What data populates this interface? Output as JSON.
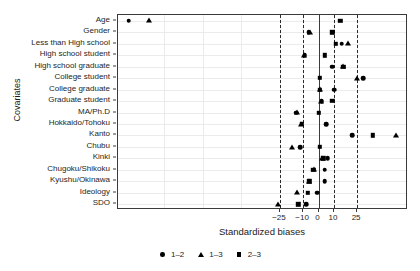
{
  "chart_data": {
    "type": "scatter",
    "title": "",
    "xlabel": "Standardized biases",
    "ylabel": "Covariates",
    "xlim": [
      -130,
      58
    ],
    "xticks": [
      -25,
      -10,
      0,
      10,
      25
    ],
    "xtick_labels": [
      "−25",
      "−10",
      "0",
      "10",
      "25"
    ],
    "reference_lines": {
      "dashed": [
        -25,
        -10,
        10,
        25
      ],
      "solid": [
        0
      ]
    },
    "grid": true,
    "legend_position": "bottom",
    "categories": [
      "Age",
      "Gender",
      "Less than High school",
      "High school student",
      "High school graduate",
      "College student",
      "College graduate",
      "Graduate student",
      "MA/Ph.D",
      "Hokkaido/Tohoku",
      "Kanto",
      "Chubu",
      "Kinki",
      "Chugoku/Shikoku",
      "Kyushu/Okinawa",
      "Ideology",
      "SDO"
    ],
    "series": [
      {
        "name": "1–2",
        "marker": "circle",
        "values": [
          -123,
          -6.5,
          15,
          -9,
          9,
          29,
          10,
          2,
          -14.5,
          5,
          22,
          -12,
          6,
          4,
          4,
          -1,
          -8
        ]
      },
      {
        "name": "1–3",
        "marker": "triangle",
        "values": [
          -110,
          -5.5,
          19,
          -9.5,
          16,
          25,
          1,
          1.5,
          -14,
          -11.5,
          50,
          -17,
          2.5,
          -3,
          -6.5,
          -14,
          -26
        ]
      },
      {
        "name": "2–3",
        "marker": "square",
        "values": [
          14,
          9,
          11,
          4,
          16,
          1,
          1,
          9,
          0,
          -11,
          35,
          1,
          3,
          -3.5,
          -6,
          -7,
          -13
        ]
      }
    ]
  },
  "legend": {
    "entries": [
      {
        "label": "1–2",
        "marker": "circle"
      },
      {
        "label": "1–3",
        "marker": "triangle"
      },
      {
        "label": "2–3",
        "marker": "square"
      }
    ]
  }
}
